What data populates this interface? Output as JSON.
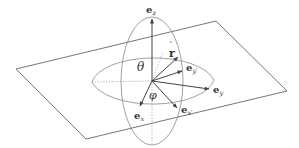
{
  "diagram": {
    "colors": {
      "stroke": "#555555",
      "text": "#333333",
      "background": "#ffffff"
    },
    "labels": {
      "ez": "e",
      "ez_sub": "z",
      "ex": "e",
      "ex_sub": "x",
      "exp": "e",
      "exp_sub": "x′",
      "ey": "e",
      "ey_sub": "y",
      "eyp": "e",
      "eyp_sub": "y′",
      "r": "r",
      "r_hat": "˜",
      "theta": "θ",
      "phi": "φ"
    }
  }
}
